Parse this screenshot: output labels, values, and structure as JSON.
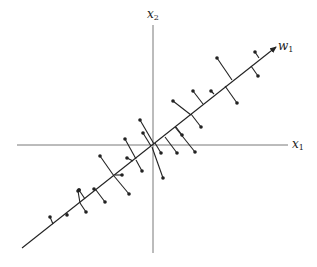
{
  "diagram": {
    "title": "",
    "labels": {
      "x2_axis": {
        "main": "x",
        "sub": "2"
      },
      "x1_axis": {
        "main": "x",
        "sub": "1"
      },
      "w1_axis": {
        "main": "w",
        "sub": "1"
      }
    },
    "colors": {
      "ink": "#222222",
      "background": "#ffffff"
    },
    "axes": {
      "origin": [
        153,
        145
      ],
      "x1": {
        "from": [
          17,
          145
        ],
        "to": [
          288,
          145
        ]
      },
      "x2": {
        "from": [
          153,
          25
        ],
        "to": [
          153,
          253
        ]
      },
      "w1": {
        "from": [
          22,
          248
        ],
        "to": [
          276,
          47
        ],
        "arrow": true
      }
    },
    "points": [
      {
        "p": [
          217,
          58
        ],
        "proj": [
          232,
          80
        ]
      },
      {
        "p": [
          255,
          52
        ],
        "proj": [
          259,
          58
        ]
      },
      {
        "p": [
          258,
          76
        ],
        "proj": [
          251,
          66
        ]
      },
      {
        "p": [
          237,
          103
        ],
        "proj": [
          225,
          86
        ]
      },
      {
        "p": [
          211,
          91
        ],
        "proj": [
          214,
          94
        ]
      },
      {
        "p": [
          193,
          91
        ],
        "proj": [
          203,
          104
        ]
      },
      {
        "p": [
          173,
          101
        ],
        "proj": [
          191,
          115
        ]
      },
      {
        "p": [
          201,
          127
        ],
        "proj": [
          191,
          114
        ]
      },
      {
        "p": [
          182,
          135
        ],
        "proj": [
          176,
          127
        ]
      },
      {
        "p": [
          195,
          152
        ],
        "proj": [
          175,
          127
        ]
      },
      {
        "p": [
          177,
          153
        ],
        "proj": [
          165,
          137
        ]
      },
      {
        "p": [
          161,
          153
        ],
        "proj": [
          155,
          143
        ]
      },
      {
        "p": [
          140,
          120
        ],
        "proj": [
          154,
          144
        ]
      },
      {
        "p": [
          143,
          133
        ],
        "proj": [
          151,
          146
        ]
      },
      {
        "p": [
          163,
          178
        ],
        "proj": [
          152,
          147
        ]
      },
      {
        "p": [
          125,
          139
        ],
        "proj": [
          136,
          159
        ]
      },
      {
        "p": [
          127,
          158
        ],
        "proj": [
          133,
          161
        ]
      },
      {
        "p": [
          142,
          171
        ],
        "proj": [
          136,
          160
        ]
      },
      {
        "p": [
          100,
          156
        ],
        "proj": [
          114,
          176
        ]
      },
      {
        "p": [
          122,
          175
        ],
        "proj": [
          115,
          175
        ]
      },
      {
        "p": [
          129,
          194
        ],
        "proj": [
          114,
          176
        ]
      },
      {
        "p": [
          79,
          190
        ],
        "proj": [
          85,
          199
        ]
      },
      {
        "p": [
          79,
          190
        ],
        "proj": [
          79,
          190
        ]
      },
      {
        "p": [
          94,
          189
        ],
        "proj": [
          96,
          190
        ]
      },
      {
        "p": [
          105,
          202
        ],
        "proj": [
          96,
          190
        ]
      },
      {
        "p": [
          78,
          191
        ],
        "proj": [
          80,
          203
        ]
      },
      {
        "p": [
          86,
          212
        ],
        "proj": [
          80,
          203
        ]
      },
      {
        "p": [
          50,
          217
        ],
        "proj": [
          53,
          224
        ]
      },
      {
        "p": [
          67,
          215
        ],
        "proj": [
          67,
          213
        ]
      }
    ]
  }
}
